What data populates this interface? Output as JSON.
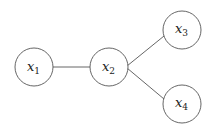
{
  "diagram": {
    "type": "graph",
    "nodes": [
      {
        "id": "x1",
        "base": "x",
        "sub": "1",
        "cx": 34,
        "cy": 67,
        "r": 19
      },
      {
        "id": "x2",
        "base": "x",
        "sub": "2",
        "cx": 109,
        "cy": 67,
        "r": 19
      },
      {
        "id": "x3",
        "base": "x",
        "sub": "3",
        "cx": 182,
        "cy": 30,
        "r": 19
      },
      {
        "id": "x4",
        "base": "x",
        "sub": "4",
        "cx": 182,
        "cy": 104,
        "r": 19
      }
    ],
    "edges": [
      {
        "from": "x1",
        "to": "x2"
      },
      {
        "from": "x2",
        "to": "x3"
      },
      {
        "from": "x2",
        "to": "x4"
      }
    ],
    "colors": {
      "stroke": "#555555",
      "text": "#222222",
      "background": "#ffffff"
    }
  }
}
